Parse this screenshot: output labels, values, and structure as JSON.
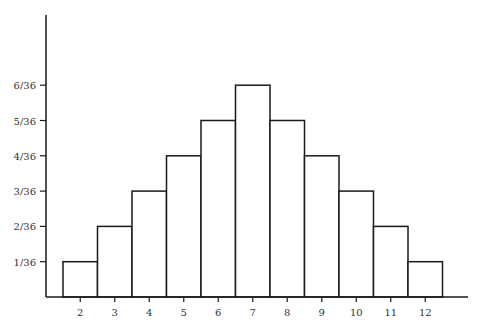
{
  "chart_data": {
    "type": "bar",
    "title": "",
    "xlabel": "",
    "ylabel": "",
    "categories": [
      "2",
      "3",
      "4",
      "5",
      "6",
      "7",
      "8",
      "9",
      "10",
      "11",
      "12"
    ],
    "values": [
      1,
      2,
      3,
      4,
      5,
      6,
      5,
      4,
      3,
      2,
      1
    ],
    "value_denominator": 36,
    "y_tick_labels": [
      "1/36",
      "2/36",
      "3/36",
      "4/36",
      "5/36",
      "6/36"
    ],
    "ylim": [
      0,
      7
    ],
    "grid": false,
    "legend": null,
    "bar_style": "histogram-outline"
  },
  "colors": {
    "stroke": "#1a1a1a",
    "fill": "#ffffff",
    "text": "#333333"
  }
}
